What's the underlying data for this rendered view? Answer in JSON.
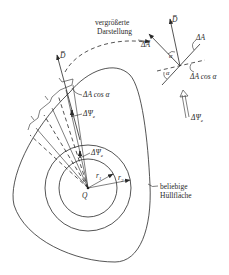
{
  "labels": {
    "magnified_view": [
      "vergrößerte",
      "Darstellung"
    ],
    "flux_density_vector": "D̅",
    "area_vector": "ΔA̅",
    "area_element": "ΔA",
    "projected_area_left": "ΔA cos α",
    "projected_area_right": "ΔA cos α",
    "angle_alpha_1": "α",
    "angle_alpha_2": "α",
    "flux_outer": "ΔΨ",
    "flux_outer_sub": "e",
    "flux_inner": "ΔΨ",
    "flux_inner_sub": "e",
    "flux_detail": "ΔΨ",
    "flux_detail_sub": "e",
    "charge": "Q",
    "radius_1": "r",
    "radius_1_sub": "1",
    "radius_2": "r",
    "radius_2_sub": "2",
    "arbitrary_surface": [
      "beliebige",
      "Hüllfläche"
    ]
  },
  "colors": {
    "ink": "#2a2a2a",
    "background": "#ffffff"
  }
}
